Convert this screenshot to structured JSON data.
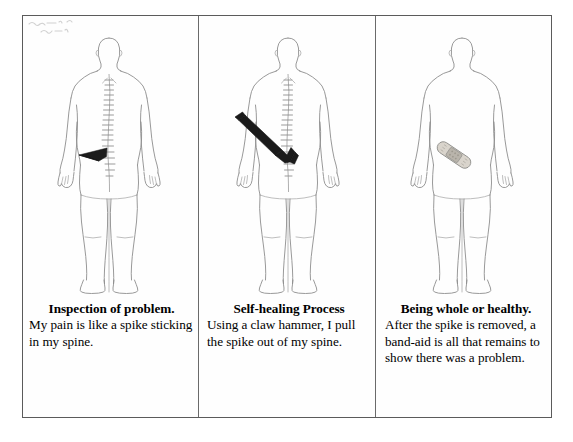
{
  "figure": {
    "panels": [
      {
        "id": "panel-inspection",
        "heading": "Inspection of problem.",
        "body": "My pain is like a spike sticking in my spine.",
        "figure_description": "Posterior view line drawing of a human body with the spine drawn and a dark wedge-shaped spike stuck into the lower back.",
        "annotation_scribble": "illegible handwritten note",
        "icons": {
          "body": "human-body-posterior-icon",
          "spine": "spine-icon",
          "object": "spike-icon"
        }
      },
      {
        "id": "panel-self-healing",
        "heading": "Self-healing Process",
        "body": "Using a claw hammer, I pull the spike out of my spine.",
        "figure_description": "Posterior view line drawing of a human body with the spine drawn and a black claw hammer angled from the upper left with its claw hooked at the lower spine.",
        "icons": {
          "body": "human-body-posterior-icon",
          "spine": "spine-icon",
          "object": "claw-hammer-icon"
        }
      },
      {
        "id": "panel-being-whole",
        "heading": "Being whole or healthy.",
        "body": "After the spike is removed, a band-aid is all that remains to show there was a problem.",
        "figure_description": "Posterior view line drawing of a human body with no spine drawn and a small band-aid placed diagonally on the lower back.",
        "icons": {
          "body": "human-body-posterior-icon",
          "object": "band-aid-icon"
        }
      }
    ]
  },
  "colors": {
    "frame_border": "#5b5b5b",
    "divider": "#6a6a6a",
    "body_outline": "#8d8d8d",
    "spine_stroke": "#8a8a8a",
    "spike_fill": "#1c1c1c",
    "hammer_fill": "#1a1a1a",
    "bandaid_fill": "#d9d4cc",
    "bandaid_pad": "#b9b4ab",
    "page_background": "#ffffff",
    "text": "#000000"
  }
}
